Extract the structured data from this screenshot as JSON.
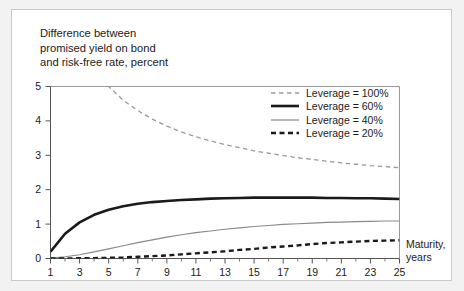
{
  "figure": {
    "title": "Difference between\npromised yield on bond\nand risk-free rate, percent",
    "xaxis_label": "Maturity,\nyears",
    "panel_background": "#ffffff",
    "outer_background": "#f2f2f2"
  },
  "legend": {
    "position": "top-right-inside",
    "entries": [
      {
        "label": "Leverage = 100%",
        "style": "dashed-thin",
        "color": "#9a9a9a"
      },
      {
        "label": "Leverage = 60%",
        "style": "solid-thick",
        "color": "#1a1a1a"
      },
      {
        "label": "Leverage = 40%",
        "style": "solid-thin",
        "color": "#8a8a8a"
      },
      {
        "label": "Leverage = 20%",
        "style": "dashed-thick",
        "color": "#1a1a1a"
      }
    ]
  },
  "axes": {
    "x_ticks_major": [
      "1",
      "3",
      "5",
      "7",
      "9",
      "11",
      "13",
      "15",
      "17",
      "19",
      "21",
      "23",
      "25"
    ],
    "y_ticks": [
      "0",
      "1",
      "2",
      "3",
      "4",
      "5"
    ],
    "xlim": [
      1,
      25
    ],
    "ylim": [
      0,
      5
    ],
    "grid": false
  },
  "chart_data": {
    "type": "line",
    "title": "Difference between promised yield on bond and risk-free rate, percent",
    "xlabel": "Maturity, years",
    "ylabel": "Difference between promised yield on bond and risk-free rate, percent",
    "xlim": [
      1,
      25
    ],
    "ylim": [
      0,
      5
    ],
    "x_ticks": [
      1,
      3,
      5,
      7,
      9,
      11,
      13,
      15,
      17,
      19,
      21,
      23,
      25
    ],
    "y_ticks": [
      0,
      1,
      2,
      3,
      4,
      5
    ],
    "grid": false,
    "legend_position": "upper right",
    "x": [
      1,
      2,
      3,
      4,
      5,
      6,
      7,
      8,
      9,
      10,
      11,
      12,
      13,
      14,
      15,
      16,
      17,
      18,
      19,
      20,
      21,
      22,
      23,
      24,
      25
    ],
    "series": [
      {
        "name": "Leverage = 100%",
        "style": "dashed",
        "color": "#9a9a9a",
        "values": [
          9.8,
          7.5,
          6.3,
          5.55,
          5.0,
          4.6,
          4.3,
          4.05,
          3.85,
          3.68,
          3.54,
          3.42,
          3.31,
          3.22,
          3.13,
          3.06,
          2.99,
          2.93,
          2.88,
          2.83,
          2.78,
          2.74,
          2.7,
          2.67,
          2.64
        ]
      },
      {
        "name": "Leverage = 60%",
        "style": "solid",
        "color": "#1a1a1a",
        "values": [
          0.2,
          0.72,
          1.05,
          1.27,
          1.42,
          1.52,
          1.59,
          1.64,
          1.67,
          1.7,
          1.72,
          1.74,
          1.75,
          1.76,
          1.77,
          1.77,
          1.77,
          1.77,
          1.77,
          1.76,
          1.76,
          1.75,
          1.75,
          1.74,
          1.73
        ]
      },
      {
        "name": "Leverage = 40%",
        "style": "solid",
        "color": "#8a8a8a",
        "values": [
          0.01,
          0.05,
          0.11,
          0.19,
          0.28,
          0.37,
          0.46,
          0.54,
          0.62,
          0.69,
          0.75,
          0.8,
          0.85,
          0.89,
          0.93,
          0.96,
          0.99,
          1.01,
          1.03,
          1.05,
          1.06,
          1.07,
          1.08,
          1.09,
          1.09
        ]
      },
      {
        "name": "Leverage = 20%",
        "style": "dashed",
        "color": "#1a1a1a",
        "values": [
          0.0,
          0.0,
          0.01,
          0.01,
          0.02,
          0.03,
          0.05,
          0.07,
          0.09,
          0.12,
          0.15,
          0.18,
          0.21,
          0.25,
          0.28,
          0.32,
          0.35,
          0.38,
          0.42,
          0.45,
          0.47,
          0.49,
          0.51,
          0.52,
          0.53
        ]
      }
    ]
  }
}
